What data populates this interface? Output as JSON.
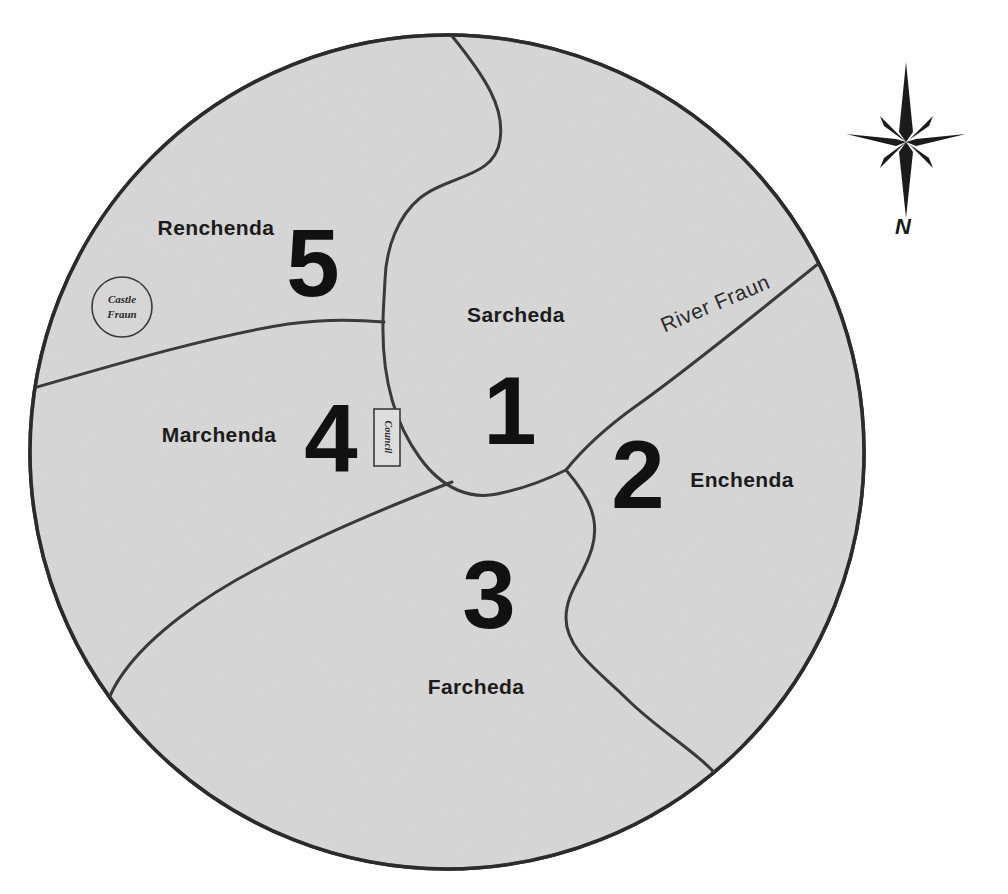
{
  "map": {
    "title": "Island map with five numbered regions",
    "shape": "circular-island",
    "land_fill": "#d6d6d6",
    "outline_color": "#2b2b2b",
    "border_color": "#3a3a3a",
    "background": "#ffffff",
    "regions": [
      {
        "id": "sarcheda",
        "number": "1",
        "label": "Sarcheda",
        "label_x": 516,
        "label_y": 322,
        "number_x": 510,
        "number_y": 440
      },
      {
        "id": "enchenda",
        "number": "2",
        "label": "Enchenda",
        "label_x": 742,
        "label_y": 487,
        "number_x": 638,
        "number_y": 504
      },
      {
        "id": "farcheda",
        "number": "3",
        "label": "Farcheda",
        "label_x": 476,
        "label_y": 694,
        "number_x": 489,
        "number_y": 625
      },
      {
        "id": "marchenda",
        "number": "4",
        "label": "Marchenda",
        "label_x": 218,
        "label_y": 442,
        "number_x": 331,
        "number_y": 466
      },
      {
        "id": "renchenda",
        "number": "5",
        "label": "Renchenda",
        "label_x": 215,
        "label_y": 235,
        "number_x": 313,
        "number_y": 296
      }
    ],
    "features": [
      {
        "id": "river-fraun",
        "type": "river",
        "label": "River Fraun",
        "label_x": 718,
        "label_y": 310,
        "label_rotation": -23
      },
      {
        "id": "castle-fraun",
        "type": "settlement",
        "label_line1": "Castle",
        "label_line2": "Fraun",
        "x": 122,
        "y": 307,
        "radius": 30
      },
      {
        "id": "council",
        "type": "building",
        "label": "Council",
        "x": 387,
        "y": 437,
        "width": 26,
        "height": 57,
        "label_rotation": 90
      }
    ],
    "compass": {
      "label": "N",
      "x": 906,
      "y": 140,
      "label_x": 903,
      "label_y": 227
    }
  }
}
